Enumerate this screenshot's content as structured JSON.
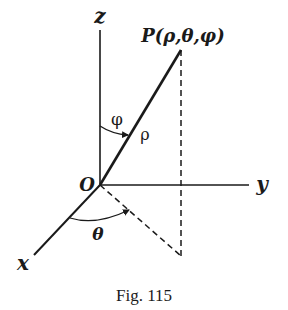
{
  "figure": {
    "caption": "Fig. 115",
    "point_label": "P(ρ,θ,φ)",
    "origin_label": "O",
    "axes": {
      "x_label": "x",
      "y_label": "y",
      "z_label": "z"
    },
    "angles": {
      "phi_label": "φ",
      "theta_label": "θ"
    },
    "radius_label": "ρ",
    "colors": {
      "ink": "#1a1a1a",
      "background": "#ffffff"
    }
  }
}
